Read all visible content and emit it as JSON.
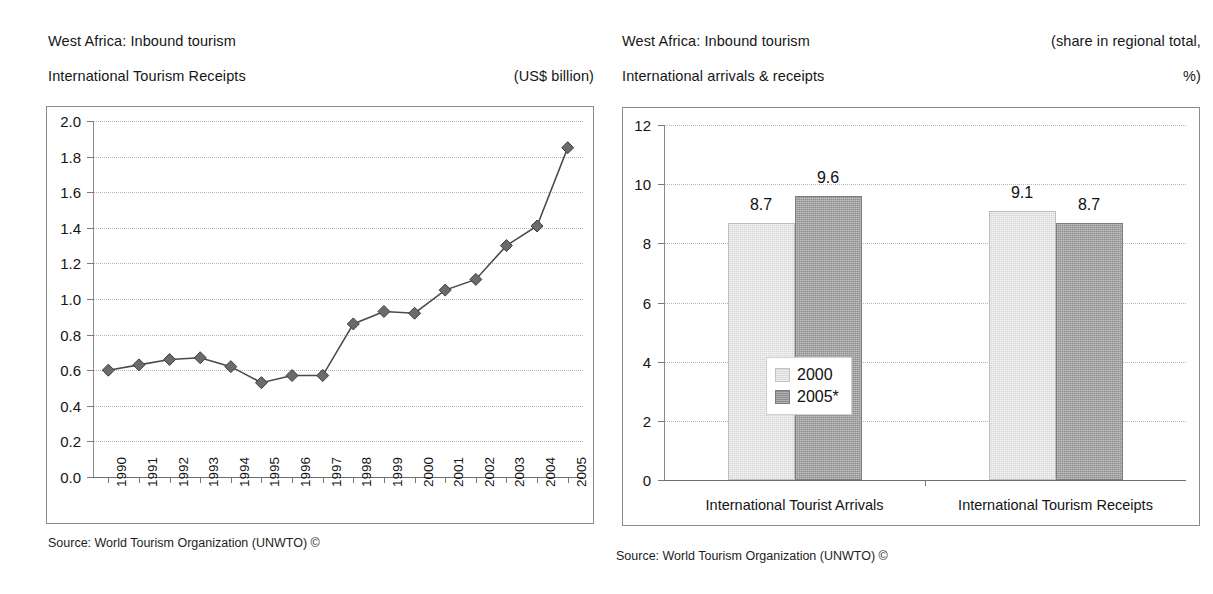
{
  "left_panel": {
    "title_line1": "West Africa: Inbound tourism",
    "title_line2": "International Tourism Receipts",
    "unit_note": "(US$ billion)",
    "source": "Source: World Tourism Organization (UNWTO) ©"
  },
  "right_panel": {
    "title_line1": "West Africa: Inbound tourism",
    "title_line2": "International arrivals & receipts",
    "unit_note_line1": "(share in regional total,",
    "unit_note_line2": "%)",
    "source": "Source: World Tourism Organization (UNWTO) ©"
  },
  "chart_data": [
    {
      "type": "line",
      "title": "West Africa: Inbound tourism — International Tourism Receipts",
      "xlabel": "",
      "ylabel": "(US$ billion)",
      "ylim": [
        0.0,
        2.0
      ],
      "ytick_step": 0.2,
      "yticks": [
        "2.0",
        "1.8",
        "1.6",
        "1.4",
        "1.2",
        "1.0",
        "0.8",
        "0.6",
        "0.4",
        "0.2",
        "0.0"
      ],
      "grid": true,
      "legend": "none",
      "marker": "diamond",
      "categories": [
        "1990",
        "1991",
        "1992",
        "1993",
        "1994",
        "1995",
        "1996",
        "1997",
        "1998",
        "1999",
        "2000",
        "2001",
        "2002",
        "2003",
        "2004",
        "2005"
      ],
      "values": [
        0.6,
        0.63,
        0.66,
        0.67,
        0.62,
        0.53,
        0.57,
        0.57,
        0.86,
        0.93,
        0.92,
        1.05,
        1.11,
        1.3,
        1.41,
        1.85
      ]
    },
    {
      "type": "bar",
      "title": "West Africa: Inbound tourism — International arrivals & receipts",
      "xlabel": "",
      "ylabel": "(share in regional total, %)",
      "ylim": [
        0,
        12
      ],
      "ytick_step": 2,
      "yticks": [
        "12",
        "10",
        "8",
        "6",
        "4",
        "2",
        "0"
      ],
      "grid": true,
      "legend": "inside-center-left",
      "categories": [
        "International Tourist Arrivals",
        "International Tourism Receipts"
      ],
      "series": [
        {
          "name": "2000",
          "values": [
            8.7,
            9.1
          ],
          "color": "#d4d4d4"
        },
        {
          "name": "2005*",
          "values": [
            9.6,
            8.7
          ],
          "color": "#8e8e8e"
        }
      ],
      "data_labels": [
        "8.7",
        "9.6",
        "9.1",
        "8.7"
      ]
    }
  ]
}
